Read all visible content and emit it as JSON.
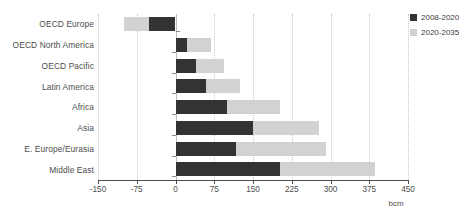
{
  "chart_data": {
    "type": "bar",
    "orientation": "horizontal",
    "stacked": true,
    "title": "",
    "subtitle": "",
    "xlabel": "bcm",
    "ylabel": "",
    "unit": "bcm",
    "xlim": [
      -150,
      450
    ],
    "xticks": [
      -150,
      -75,
      0,
      75,
      150,
      225,
      300,
      375,
      450
    ],
    "xtick_labels": [
      "-150",
      "-75",
      "0",
      "75",
      "150",
      "225",
      "300",
      "375",
      "450"
    ],
    "grid": "vertical-dotted",
    "legend_position": "top-right",
    "categories": [
      "OECD Europe",
      "OECD North America",
      "OECD Pacific",
      "Latin America",
      "Africa",
      "Asia",
      "E. Europe/Eurasia",
      "Middle East"
    ],
    "series": [
      {
        "name": "2008-2020",
        "color": "#333333",
        "values": [
          -51,
          22,
          39,
          59,
          100,
          150,
          118,
          202
        ]
      },
      {
        "name": "2020-2035",
        "color": "#d2d2d2",
        "values": [
          -49,
          46,
          55,
          66,
          102,
          128,
          174,
          184
        ]
      }
    ],
    "totals": [
      -100,
      68,
      94,
      125,
      202,
      278,
      292,
      386
    ]
  },
  "legend": {
    "items": [
      {
        "label": "2008-2020",
        "color": "#333333"
      },
      {
        "label": "2020-2035",
        "color": "#d2d2d2"
      }
    ]
  }
}
